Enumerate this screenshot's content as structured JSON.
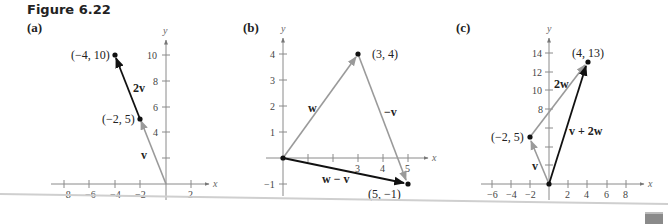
{
  "figure": {
    "title": "Figure 6.22",
    "panels": [
      {
        "label": "(a)",
        "axes": {
          "x_label": "x",
          "y_label": "y",
          "x_ticks": [
            "−8",
            "−6",
            "−4",
            "−2",
            "2"
          ],
          "y_ticks": [
            "4",
            "6",
            "8",
            "10"
          ]
        },
        "points": [
          {
            "label": "(−4, 10)",
            "x": -4,
            "y": 10
          },
          {
            "label": "(−2, 5)",
            "x": -2,
            "y": 5
          }
        ],
        "vectors": [
          {
            "label": "v",
            "from": [
              0,
              0
            ],
            "to": [
              -2,
              5
            ],
            "color": "#9a9a9a"
          },
          {
            "label": "2v",
            "from": [
              -2,
              5
            ],
            "to": [
              -4,
              10
            ],
            "color": "#111111"
          }
        ]
      },
      {
        "label": "(b)",
        "axes": {
          "x_label": "x",
          "y_label": "y",
          "x_ticks": [
            "3",
            "4",
            "5"
          ],
          "y_ticks": [
            "−1",
            "1",
            "2",
            "3",
            "4"
          ]
        },
        "points": [
          {
            "label": "(3, 4)",
            "x": 3,
            "y": 4
          },
          {
            "label": "(5, −1)",
            "x": 5,
            "y": -1
          }
        ],
        "vectors": [
          {
            "label": "w",
            "from": [
              0,
              0
            ],
            "to": [
              3,
              4
            ],
            "color": "#9a9a9a"
          },
          {
            "label": "−v",
            "from": [
              3,
              4
            ],
            "to": [
              5,
              -1
            ],
            "color": "#9a9a9a"
          },
          {
            "label": "w − v",
            "from": [
              0,
              0
            ],
            "to": [
              5,
              -1
            ],
            "color": "#111111"
          }
        ]
      },
      {
        "label": "(c)",
        "axes": {
          "x_label": "x",
          "y_label": "y",
          "x_ticks": [
            "−6",
            "−4",
            "−2",
            "2",
            "4",
            "6",
            "8"
          ],
          "y_ticks": [
            "8",
            "10",
            "12",
            "14"
          ]
        },
        "points": [
          {
            "label": "(−2, 5)",
            "x": -2,
            "y": 5
          },
          {
            "label": "(4, 13)",
            "x": 4,
            "y": 13
          }
        ],
        "vectors": [
          {
            "label": "v",
            "from": [
              0,
              0
            ],
            "to": [
              -2,
              5
            ],
            "color": "#9a9a9a"
          },
          {
            "label": "2w",
            "from": [
              -2,
              5
            ],
            "to": [
              4,
              13
            ],
            "color": "#9a9a9a"
          },
          {
            "label": "v + 2w",
            "from": [
              0,
              0
            ],
            "to": [
              4,
              13
            ],
            "color": "#111111"
          }
        ]
      }
    ]
  }
}
